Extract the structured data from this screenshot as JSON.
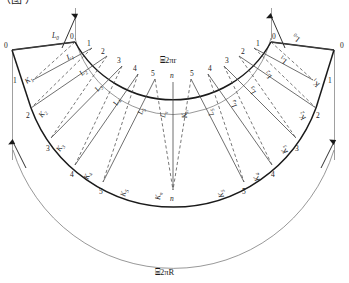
{
  "figure": {
    "caption_partial": "（图 ）",
    "colors": {
      "heavy_line": "#1a1a1a",
      "light_line": "#6b6b6b",
      "dashed_line": "#555555",
      "text": "#1a1a1a",
      "background": "#ffffff"
    }
  },
  "arcs": {
    "inner_label": "⌸2πr",
    "outer_label": "⌸2πR",
    "inner_symbol": "⌸",
    "inner_text": "2πr",
    "outer_text": "2πR"
  },
  "inner_arc_ticks": {
    "left": [
      "0",
      "1",
      "2",
      "3",
      "4",
      "5"
    ],
    "center": "n",
    "right": [
      "5",
      "4",
      "3",
      "2",
      "1",
      "0"
    ]
  },
  "outer_arc_ticks": {
    "left": [
      "0",
      "1",
      "2",
      "3",
      "4",
      "5"
    ],
    "center": "n",
    "right": [
      "5",
      "4",
      "3",
      "2",
      "1",
      "0"
    ]
  },
  "left_edge_ticks": [
    "0",
    "1",
    "2"
  ],
  "right_edge_ticks": [
    "0",
    "1",
    "2"
  ],
  "solid_generators_left": [
    {
      "base": "L",
      "sub": "0"
    },
    {
      "base": "L",
      "sub": "1"
    },
    {
      "base": "L",
      "sub": "2"
    },
    {
      "base": "L",
      "sub": "3"
    },
    {
      "base": "L",
      "sub": "4"
    },
    {
      "base": "L",
      "sub": "5"
    },
    {
      "base": "L",
      "sub": "n"
    }
  ],
  "dashed_generators_left": [
    {
      "base": "K",
      "sub": "1"
    },
    {
      "base": "K",
      "sub": "2"
    },
    {
      "base": "K",
      "sub": "3"
    },
    {
      "base": "K",
      "sub": "4"
    },
    {
      "base": "K",
      "sub": "5"
    },
    {
      "base": "K",
      "sub": "n"
    }
  ],
  "solid_generators_right": [
    {
      "base": "K",
      "sub": "n"
    },
    {
      "base": "K",
      "sub": "5"
    },
    {
      "base": "K",
      "sub": "4"
    },
    {
      "base": "K",
      "sub": "3"
    },
    {
      "base": "K",
      "sub": "2"
    },
    {
      "base": "K",
      "sub": "1"
    }
  ],
  "dashed_generators_right": [
    {
      "base": "L",
      "sub": "n"
    },
    {
      "base": "L",
      "sub": "5"
    },
    {
      "base": "L",
      "sub": "4"
    },
    {
      "base": "L",
      "sub": "3"
    },
    {
      "base": "L",
      "sub": "2"
    },
    {
      "base": "L",
      "sub": "1"
    },
    {
      "base": "L",
      "sub": "0"
    }
  ],
  "labels": {
    "L0": "L",
    "L0s": "0",
    "L1": "L",
    "L1s": "1",
    "L2": "L",
    "L2s": "2",
    "L3": "L",
    "L3s": "3",
    "L4": "L",
    "L4s": "4",
    "L5": "L",
    "L5s": "5",
    "Ln": "L",
    "Lns": "n",
    "K1": "K",
    "K1s": "1",
    "K2": "K",
    "K2s": "2",
    "K3": "K",
    "K3s": "3",
    "K4": "K",
    "K4s": "4",
    "K5": "K",
    "K5s": "5",
    "Kn": "K",
    "Kns": "n"
  },
  "numbers": {
    "n0": "0",
    "n1": "1",
    "n2": "2",
    "n3": "3",
    "n4": "4",
    "n5": "5",
    "nn": "n"
  }
}
